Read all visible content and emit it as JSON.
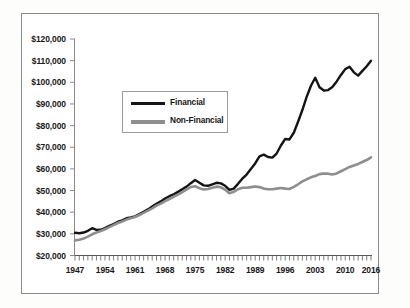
{
  "chart_data": {
    "type": "line",
    "title": "",
    "subtitle": "",
    "xlabel": "",
    "ylabel": "",
    "grid": false,
    "legend_position": "inside-upper-left",
    "xlim": [
      1947,
      2016
    ],
    "ylim": [
      20000,
      120000
    ],
    "y_tick_labels": [
      "$120,000",
      "$110,000",
      "$100,000",
      "$90,000",
      "$80,000",
      "$70,000",
      "$60,000",
      "$50,000",
      "$40,000",
      "$30,000",
      "$20,000"
    ],
    "y_tick_values": [
      120000,
      110000,
      100000,
      90000,
      80000,
      70000,
      60000,
      50000,
      40000,
      30000,
      20000
    ],
    "x_tick_labels": [
      "1947",
      "1954",
      "1961",
      "1968",
      "1975",
      "1982",
      "1989",
      "1996",
      "2003",
      "2010",
      "2016"
    ],
    "x_tick_values": [
      1947,
      1954,
      1961,
      1968,
      1975,
      1982,
      1989,
      1996,
      2003,
      2010,
      2016
    ],
    "x": [
      1947,
      1948,
      1949,
      1950,
      1951,
      1952,
      1953,
      1954,
      1955,
      1956,
      1957,
      1958,
      1959,
      1960,
      1961,
      1962,
      1963,
      1964,
      1965,
      1966,
      1967,
      1968,
      1969,
      1970,
      1971,
      1972,
      1973,
      1974,
      1975,
      1976,
      1977,
      1978,
      1979,
      1980,
      1981,
      1982,
      1983,
      1984,
      1985,
      1986,
      1987,
      1988,
      1989,
      1990,
      1991,
      1992,
      1993,
      1994,
      1995,
      1996,
      1997,
      1998,
      1999,
      2000,
      2001,
      2002,
      2003,
      2004,
      2005,
      2006,
      2007,
      2008,
      2009,
      2010,
      2011,
      2012,
      2013,
      2014,
      2015,
      2016
    ],
    "series": [
      {
        "name": "Financial",
        "color": "#141414",
        "values": [
          30500,
          30300,
          30600,
          31400,
          32600,
          31800,
          31900,
          32700,
          33700,
          34500,
          35600,
          36200,
          37200,
          37600,
          38100,
          39100,
          40200,
          41300,
          42600,
          43900,
          45000,
          46300,
          47400,
          48300,
          49400,
          50600,
          51800,
          53400,
          54900,
          53600,
          52400,
          52200,
          52900,
          53600,
          53300,
          52200,
          50300,
          50900,
          53100,
          55500,
          57400,
          59900,
          62500,
          65800,
          66600,
          65500,
          65200,
          67100,
          70800,
          73800,
          73600,
          76700,
          81800,
          87200,
          93300,
          98400,
          102100,
          97700,
          96200,
          96400,
          97800,
          100400,
          103400,
          106100,
          107200,
          104600,
          103100,
          105300,
          107400,
          109900
        ]
      },
      {
        "name": "Non-Financial",
        "color": "#8e8e8e",
        "values": [
          27000,
          27300,
          27800,
          28700,
          29800,
          30600,
          31300,
          32100,
          33100,
          34000,
          35000,
          35700,
          36600,
          37200,
          37800,
          38700,
          39700,
          40700,
          41800,
          43000,
          44000,
          45100,
          46100,
          47100,
          48100,
          49300,
          50500,
          51600,
          52000,
          51100,
          50500,
          50700,
          51300,
          51800,
          51500,
          50400,
          48800,
          49400,
          50600,
          51300,
          51300,
          51600,
          51900,
          51600,
          50900,
          50600,
          50600,
          50900,
          51200,
          50900,
          50700,
          51700,
          52900,
          54200,
          55200,
          56100,
          56700,
          57600,
          57900,
          57800,
          57400,
          57900,
          58900,
          59900,
          60900,
          61600,
          62300,
          63200,
          64100,
          65300
        ]
      }
    ]
  },
  "legend": {
    "items": [
      {
        "label": "Financial"
      },
      {
        "label": "Non-Financial"
      }
    ]
  }
}
